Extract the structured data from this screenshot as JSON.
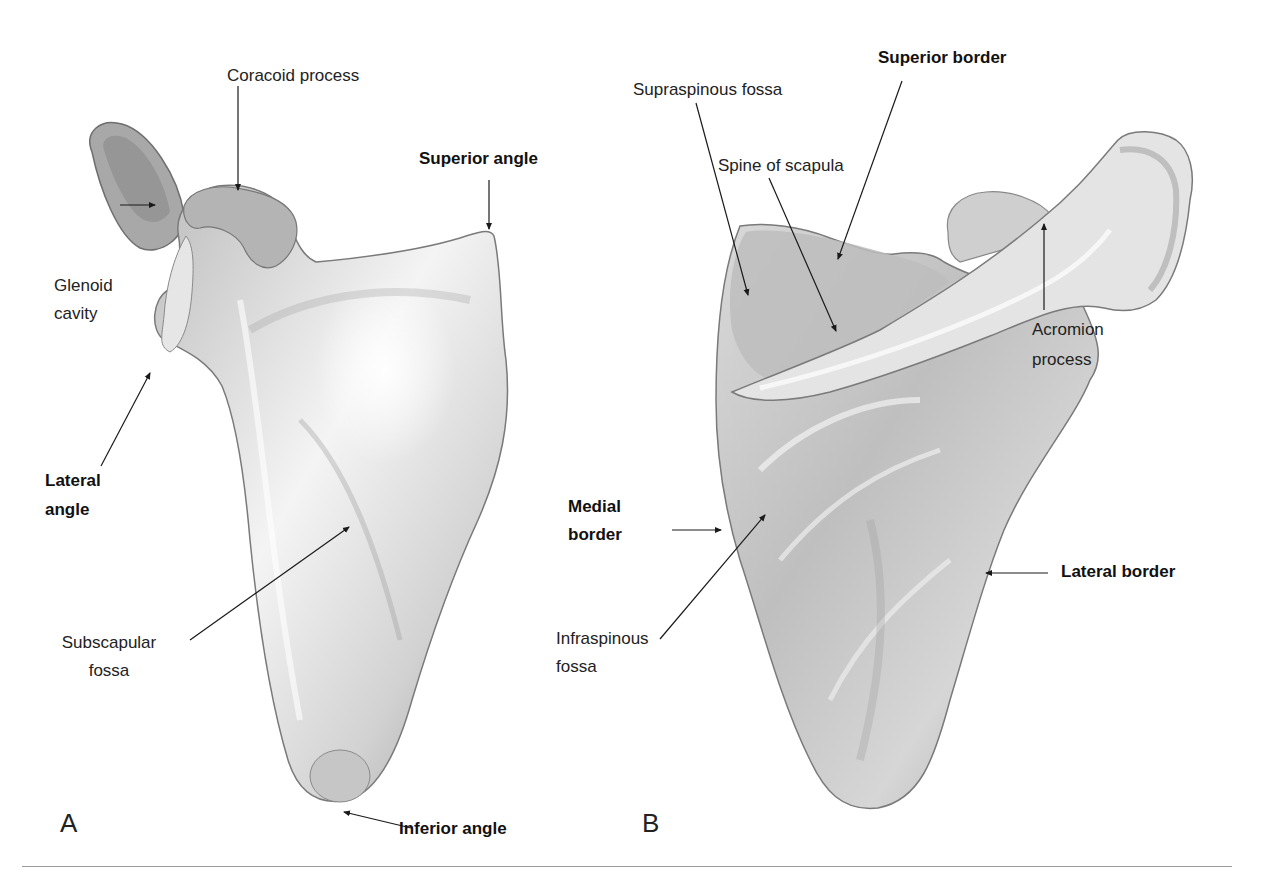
{
  "figure": {
    "colors": {
      "bone_light": "#f2f2f2",
      "bone_mid": "#c8c8c8",
      "bone_dark": "#8c8c8c",
      "leader": "#1a1a1a",
      "rule": "#9a9a9a"
    }
  },
  "panel_a": {
    "letter": "A",
    "labels": {
      "coracoid_process": "Coracoid process",
      "superior_angle": "Superior angle",
      "glenoid_cavity_1": "Glenoid",
      "glenoid_cavity_2": "cavity",
      "lateral_angle_1": "Lateral",
      "lateral_angle_2": "angle",
      "subscapular_fossa_1": "Subscapular",
      "subscapular_fossa_2": "fossa",
      "inferior_angle": "Inferior angle"
    }
  },
  "panel_b": {
    "letter": "B",
    "labels": {
      "supraspinous_fossa": "Supraspinous fossa",
      "superior_border": "Superior border",
      "spine_of_scapula": "Spine of scapula",
      "acromion_process_1": "Acromion",
      "acromion_process_2": "process",
      "medial_border_1": "Medial",
      "medial_border_2": "border",
      "lateral_border": "Lateral border",
      "infraspinous_fossa_1": "Infraspinous",
      "infraspinous_fossa_2": "fossa"
    }
  }
}
